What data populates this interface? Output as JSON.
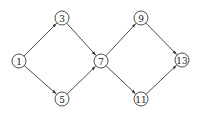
{
  "diagram": {
    "type": "directed-graph",
    "nodes": [
      {
        "id": "n1",
        "label": "1",
        "x": 19,
        "y": 61
      },
      {
        "id": "n3",
        "label": "3",
        "x": 62,
        "y": 18
      },
      {
        "id": "n5",
        "label": "5",
        "x": 62,
        "y": 99
      },
      {
        "id": "n7",
        "label": "7",
        "x": 101,
        "y": 61
      },
      {
        "id": "n9",
        "label": "9",
        "x": 141,
        "y": 18
      },
      {
        "id": "n11",
        "label": "11",
        "x": 141,
        "y": 99
      },
      {
        "id": "n13",
        "label": "13",
        "x": 182,
        "y": 60
      }
    ],
    "edges": [
      {
        "from": "1",
        "to": "3"
      },
      {
        "from": "1",
        "to": "5"
      },
      {
        "from": "3",
        "to": "7"
      },
      {
        "from": "5",
        "to": "7"
      },
      {
        "from": "7",
        "to": "9"
      },
      {
        "from": "7",
        "to": "11"
      },
      {
        "from": "9",
        "to": "13"
      },
      {
        "from": "11",
        "to": "13"
      }
    ],
    "node_radius": 7,
    "stroke_color": "#3a3a3a"
  }
}
